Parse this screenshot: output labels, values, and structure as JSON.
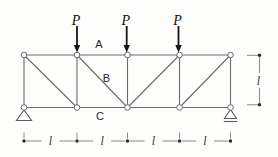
{
  "colors": {
    "background": "#fdfdfc",
    "member": "#6b6b6b",
    "node_fill": "#ffffff",
    "load": "#141414",
    "support": "#5c5c5c",
    "dimension": "#8a8a8a",
    "dim_dot": "#2b2b2b"
  },
  "truss": {
    "top_y": 55,
    "bottom_y": 107.5,
    "node_xs": [
      24,
      77,
      127.5,
      179.5,
      230.5
    ],
    "node_radius": 2.8,
    "members": [
      [
        "T0",
        "T1"
      ],
      [
        "T1",
        "T2"
      ],
      [
        "T2",
        "T3"
      ],
      [
        "T3",
        "T4"
      ],
      [
        "B0",
        "B1"
      ],
      [
        "B1",
        "B2"
      ],
      [
        "B2",
        "B3"
      ],
      [
        "B3",
        "B4"
      ],
      [
        "T0",
        "B0"
      ],
      [
        "T1",
        "B1"
      ],
      [
        "T2",
        "B2"
      ],
      [
        "T3",
        "B3"
      ],
      [
        "T4",
        "B4"
      ],
      [
        "T0",
        "B1"
      ],
      [
        "T1",
        "B2"
      ],
      [
        "T3",
        "B2"
      ],
      [
        "T4",
        "B3"
      ]
    ]
  },
  "member_labels": [
    {
      "name": "top-chord-label",
      "text": "A",
      "x": 99,
      "y": 48
    },
    {
      "name": "diagonal-label",
      "text": "B",
      "x": 106.5,
      "y": 82
    },
    {
      "name": "bottom-chord-label",
      "text": "C",
      "x": 100,
      "y": 119.5
    }
  ],
  "loads": {
    "label": "P",
    "xs": [
      77,
      126.7,
      178.5
    ],
    "label_y": 24.5,
    "tail_y": 26,
    "tip_y": 52.5
  },
  "supports": [
    {
      "type": "pin",
      "x": 24,
      "apex_y": 110,
      "base_y": 120.5,
      "half_width": 7.5
    },
    {
      "type": "roller",
      "x": 230.5,
      "apex_y": 109.5,
      "base_y": 118.5,
      "half_width": 6,
      "underline_y": 121.5,
      "underline_half": 6.75
    }
  ],
  "dimensions": {
    "bottom": {
      "label": "l",
      "y": 141,
      "tick_top_y": 132.5,
      "point_xs": [
        24,
        77,
        127.5,
        179.5,
        230.5
      ],
      "dot_radius": 1.7,
      "label_gap": 9
    },
    "right": {
      "label": "l",
      "x": 259.5,
      "top_y": 55.3,
      "bottom_y": 104.8,
      "tick_inner_x": 247,
      "label_y": 80.5,
      "label_gap": 7.5,
      "dot_radius": 1.7
    }
  }
}
